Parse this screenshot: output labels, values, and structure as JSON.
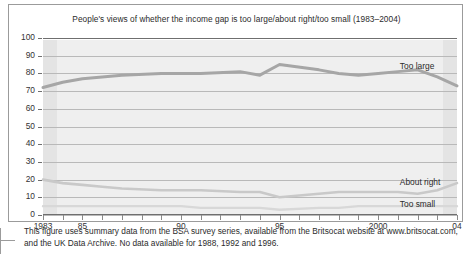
{
  "figure": {
    "title": "People's views of whether the income gap is too large/about right/too small (1983–2004)",
    "note": "This figure uses summary data from the BSA survey series, available from the Britsocat website at www.britsocat.com, and the UK Data Archive. No data available for 1988, 1992 and 1996.",
    "line_color": "#a6a6a6",
    "line_color_light": "#c9c9c9",
    "plot_bg": "#efefef",
    "axis_color": "#6f6f6f"
  },
  "chart_data": {
    "type": "line",
    "title": "People's views of whether the income gap is too large/about right/too small (1983–2004)",
    "xlabel": "",
    "ylabel": "",
    "ylim": [
      0,
      100
    ],
    "yticks": [
      0,
      10,
      20,
      30,
      40,
      50,
      60,
      70,
      80,
      90,
      100
    ],
    "ytick_labels": [
      "0",
      "10",
      "20",
      "30",
      "40",
      "50",
      "60",
      "70",
      "80",
      "90",
      "100"
    ],
    "xlim": [
      1983,
      2004
    ],
    "xticks": [
      1983,
      1984,
      1985,
      1986,
      1987,
      1988,
      1989,
      1990,
      1991,
      1992,
      1993,
      1994,
      1995,
      1996,
      1997,
      1998,
      1999,
      2000,
      2001,
      2002,
      2003,
      2004
    ],
    "xtick_labels": [
      {
        "x": 1983,
        "label": "1983"
      },
      {
        "x": 1985,
        "label": "85"
      },
      {
        "x": 1990,
        "label": "90"
      },
      {
        "x": 1995,
        "label": "95"
      },
      {
        "x": 2000,
        "label": "2000"
      },
      {
        "x": 2004,
        "label": "04"
      }
    ],
    "grid": true,
    "legend": "inline-right",
    "x": [
      1983,
      1984,
      1985,
      1986,
      1987,
      1989,
      1990,
      1991,
      1993,
      1994,
      1995,
      1997,
      1998,
      1999,
      2000,
      2001,
      2002,
      2003,
      2004
    ],
    "series": [
      {
        "name": "Too large",
        "label": "Too large",
        "values": [
          72,
          75,
          77,
          78,
          79,
          80,
          80,
          80,
          81,
          79,
          85,
          82,
          80,
          79,
          80,
          81,
          82,
          78,
          73
        ]
      },
      {
        "name": "About right",
        "label": "About right",
        "values": [
          20,
          18,
          17,
          16,
          15,
          14,
          14,
          14,
          13,
          13,
          10,
          12,
          13,
          13,
          13,
          13,
          12,
          14,
          18
        ]
      },
      {
        "name": "Too small",
        "label": "Too small",
        "values": [
          5,
          5,
          5,
          5,
          5,
          5,
          5,
          4,
          4,
          4,
          3,
          4,
          4,
          5,
          5,
          5,
          5,
          5,
          5
        ]
      }
    ]
  }
}
